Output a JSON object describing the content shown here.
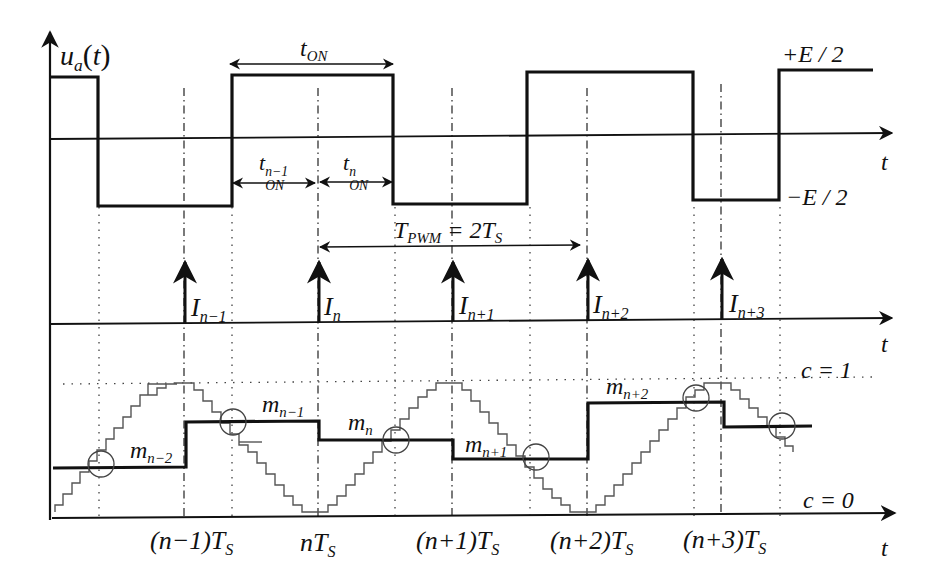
{
  "figure": {
    "top_plot": {
      "y_label": "u_a(t)",
      "x_label": "t",
      "high_level_label": "+E / 2",
      "low_level_label": "−E / 2",
      "t_on_label": "t_ON",
      "t_on_prev_label": "t_ON^(n−1)",
      "t_on_n_label": "t_ON^n"
    },
    "middle_plot": {
      "x_label": "t",
      "period_label": "T_PWM = 2T_S",
      "impulses": [
        "I_(n−1)",
        "I_n",
        "I_(n+1)",
        "I_(n+2)",
        "I_(n+3)"
      ]
    },
    "bottom_plot": {
      "x_label": "t",
      "c1_label": "c = 1",
      "c0_label": "c = 0",
      "modulating_levels": [
        "m_(n−2)",
        "m_(n−1)",
        "m_n",
        "m_(n+1)",
        "m_(n+2)"
      ],
      "x_ticks": [
        "(n−1)T_S",
        "nT_S",
        "(n+1)T_S",
        "(n+2)T_S",
        "(n+3)T_S"
      ]
    }
  },
  "text": {
    "ua": "u",
    "ua_sub": "a",
    "ua_paren": "(t)",
    "t": "t",
    "plusE": "+E / 2",
    "minusE": "−E / 2",
    "ton": "t",
    "ton_sub": "ON",
    "ton_prev_sup": "n−1",
    "ton_n_sup": "n",
    "tpwm": "T",
    "tpwm_sub": "PWM",
    "tpwm_rest": " = 2T",
    "tpwm_rest_sub": "S",
    "I": "I",
    "I_subs": [
      "n−1",
      "n",
      "n+1",
      "n+2",
      "n+3"
    ],
    "m": "m",
    "m_subs": [
      "n−2",
      "n−1",
      "n",
      "n+1",
      "n+2"
    ],
    "c1": "c = 1",
    "c0": "c = 0",
    "ticks": [
      {
        "pre": "(n−1)T",
        "sub": "S"
      },
      {
        "pre": "nT",
        "sub": "S"
      },
      {
        "pre": "(n+1)T",
        "sub": "S"
      },
      {
        "pre": "(n+2)T",
        "sub": "S"
      },
      {
        "pre": "(n+3)T",
        "sub": "S"
      }
    ]
  }
}
